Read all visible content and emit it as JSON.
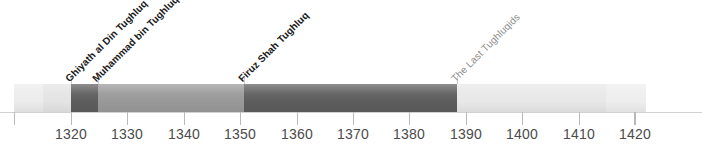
{
  "figure": {
    "background_color": "#ffffff",
    "width": 702,
    "height": 165
  },
  "chart_data": {
    "type": "bar",
    "orientation": "horizontal-timeline",
    "title": "",
    "xlabel": "",
    "ylabel": "",
    "xlim": [
      1309.9,
      1421.9
    ],
    "grid": false,
    "legend": "none",
    "axis": {
      "tick_years": [
        1320,
        1330,
        1340,
        1350,
        1360,
        1370,
        1380,
        1390,
        1400,
        1410,
        1420
      ],
      "tick_labels": [
        "1320",
        "1330",
        "1340",
        "1350",
        "1360",
        "1370",
        "1380",
        "1390",
        "1400",
        "1410",
        "1420"
      ],
      "unlabeled_tick_years": [
        1309.9,
        1419.9
      ],
      "pixels_per_decade": 56.4,
      "origin_year": 1320,
      "origin_pixel": 71
    },
    "segments": [
      {
        "name": "pre-tughluq-lead-in-a",
        "label": "",
        "start_year": 1309.9,
        "end_year": 1315.0,
        "color": "#ececec"
      },
      {
        "name": "pre-tughluq-lead-in-b",
        "label": "",
        "start_year": 1315.0,
        "end_year": 1320.0,
        "color": "#e4e4e4"
      },
      {
        "name": "ghiyath-al-din-tughluq",
        "label": "Ghiyath al Din Tughluq",
        "start_year": 1320.0,
        "end_year": 1324.8,
        "color": "#5d5d5d"
      },
      {
        "name": "muhammad-bin-tughluq",
        "label": "Muhammad bin Tughluq",
        "start_year": 1324.8,
        "end_year": 1350.7,
        "color": "#999999"
      },
      {
        "name": "firuz-shah-tughluq",
        "label": "Firuz Shah Tughluq",
        "start_year": 1350.7,
        "end_year": 1388.4,
        "color": "#5d5d5d"
      },
      {
        "name": "the-last-tughluqids-a",
        "label": "The Last Tughluqids",
        "start_year": 1388.4,
        "end_year": 1414.9,
        "color": "#e8e8e8"
      },
      {
        "name": "the-last-tughluqids-b",
        "label": "",
        "start_year": 1414.9,
        "end_year": 1421.9,
        "color": "#eeeeee"
      }
    ],
    "annotations": [
      {
        "name": "ghiyath-al-din-tughluq",
        "text": "Ghiyath al Din Tughluq",
        "year": 1320.0,
        "rotation_deg": -45,
        "emphasis": "bold",
        "color": "#1a1a1a"
      },
      {
        "name": "muhammad-bin-tughluq",
        "text": "Muhammad bin Tughluq",
        "year": 1324.8,
        "rotation_deg": -45,
        "emphasis": "bold",
        "color": "#1a1a1a"
      },
      {
        "name": "firuz-shah-tughluq",
        "text": "Firuz Shah Tughluq",
        "year": 1350.7,
        "rotation_deg": -45,
        "emphasis": "bold",
        "color": "#1a1a1a"
      },
      {
        "name": "the-last-tughluqids",
        "text": "The Last Tughluqids",
        "year": 1388.4,
        "rotation_deg": -45,
        "emphasis": "light",
        "color": "#8c8c8c"
      }
    ]
  }
}
